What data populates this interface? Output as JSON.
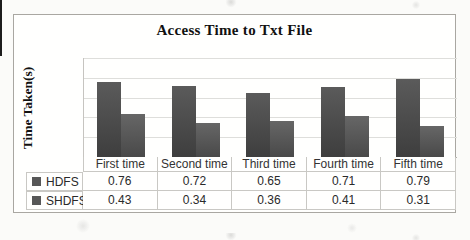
{
  "chart_data": {
    "type": "bar",
    "title": "Access Time to Txt File",
    "xlabel": "",
    "ylabel": "Time Taken(s)",
    "categories": [
      "First time",
      "Second time",
      "Third time",
      "Fourth time",
      "Fifth time"
    ],
    "series": [
      {
        "name": "HDFS",
        "values": [
          0.76,
          0.72,
          0.65,
          0.71,
          0.79
        ],
        "color": "#484848"
      },
      {
        "name": "SHDFS",
        "values": [
          0.43,
          0.34,
          0.36,
          0.41,
          0.31
        ],
        "color": "#555555"
      }
    ],
    "ylim": [
      0,
      1
    ],
    "yticks": [
      0,
      0.2,
      0.4,
      0.6,
      0.8,
      1
    ],
    "grid": true,
    "legend_position": "data-table-left",
    "data_table_shown": true,
    "value_format": "2-decimals"
  },
  "colors": {
    "legend_swatch": "#575757",
    "grid_line": "#dededb",
    "axis_line": "#b2b0ac",
    "table_border": "#c9c8c4",
    "box_border": "#a9a7a2"
  }
}
